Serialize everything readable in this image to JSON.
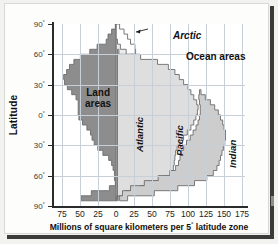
{
  "figure": {
    "axis_title_x": "Millions of square kilometers per 5° latitude zone",
    "axis_title_y": "Latitude",
    "label_land": "Land\nareas",
    "label_land_line1": "Land",
    "label_land_line2": "areas",
    "label_ocean": "Ocean areas",
    "label_arctic": "Arctic",
    "label_atlantic": "Atlantic",
    "label_pacific": "Pacific",
    "label_indian": "Indian"
  },
  "colors": {
    "land": "#8d8d8d",
    "arctic": "#ffffff",
    "atlantic": "#ececeb",
    "pacific": "#dedede",
    "indian": "#cdcdcd",
    "outline": "#6d6d6d",
    "axis": "#2b2b2b",
    "grid": "#c9cfd6",
    "plot_bg": "#ffffff",
    "page_bg": "#fdfdfb"
  },
  "chart_data": {
    "type": "area",
    "title": "",
    "subtitle": "",
    "xlabel": "Millions of square kilometers per 5° latitude zone",
    "ylabel": "Latitude",
    "orientation": "horizontal-diverging",
    "grid": true,
    "legend_position": "inline-annotations",
    "xlim": [
      -87.5,
      187.5
    ],
    "ylim": [
      -90,
      90
    ],
    "xticks": [
      -75,
      -50,
      -25,
      0,
      25,
      50,
      75,
      100,
      125,
      150,
      175
    ],
    "xtick_labels": [
      "75",
      "50",
      "25",
      "0",
      "25",
      "50",
      "75",
      "100",
      "125",
      "150",
      "175"
    ],
    "yticks": [
      90,
      60,
      30,
      0,
      -30,
      -60,
      -90
    ],
    "ytick_labels": [
      "90°",
      "60°",
      "30°",
      "0°",
      "30°",
      "60°",
      "90°"
    ],
    "x_units": "millions of square kilometers per 5° latitude zone",
    "y_units": "degrees latitude",
    "bands": [
      90,
      85,
      80,
      75,
      70,
      65,
      60,
      55,
      50,
      45,
      40,
      35,
      30,
      25,
      20,
      15,
      10,
      5,
      0,
      -5,
      -10,
      -15,
      -20,
      -25,
      -30,
      -35,
      -40,
      -45,
      -50,
      -55,
      -60,
      -65,
      -70,
      -75,
      -80,
      -85,
      -90
    ],
    "series": [
      {
        "name": "Land areas",
        "side": "left",
        "color": "#8d8d8d",
        "values": [
          1,
          6,
          11,
          14,
          19,
          26,
          36,
          49,
          58,
          64,
          68,
          72,
          71,
          66,
          59,
          55,
          52,
          52,
          50,
          46,
          40,
          36,
          34,
          31,
          25,
          17,
          10,
          7,
          5,
          3,
          2,
          2,
          9,
          34,
          48,
          41
        ]
      },
      {
        "name": "Arctic",
        "side": "right",
        "color": "#ffffff",
        "values": [
          5,
          11,
          16,
          20,
          25,
          26,
          21,
          12,
          4,
          1,
          0,
          0,
          0,
          0,
          0,
          0,
          0,
          0,
          0,
          0,
          0,
          0,
          0,
          0,
          0,
          0,
          0,
          0,
          0,
          0,
          0,
          0,
          0,
          0,
          0,
          0
        ]
      },
      {
        "name": "Atlantic",
        "side": "right",
        "color": "#ececeb",
        "values": [
          0,
          0,
          0,
          2,
          6,
          14,
          24,
          31,
          34,
          36,
          37,
          37,
          37,
          38,
          39,
          40,
          41,
          42,
          43,
          44,
          45,
          45,
          44,
          42,
          40,
          38,
          36,
          35,
          36,
          38,
          40,
          36,
          22,
          6,
          1,
          0
        ]
      },
      {
        "name": "Pacific",
        "side": "right",
        "color": "#dedede",
        "values": [
          0,
          0,
          0,
          0,
          0,
          2,
          10,
          26,
          42,
          52,
          58,
          62,
          65,
          68,
          72,
          76,
          79,
          80,
          79,
          76,
          72,
          68,
          64,
          60,
          56,
          52,
          49,
          47,
          46,
          46,
          45,
          40,
          25,
          7,
          1,
          0
        ]
      },
      {
        "name": "Indian",
        "side": "right",
        "color": "#cdcdcd",
        "values": [
          0,
          0,
          0,
          0,
          0,
          0,
          0,
          0,
          0,
          0,
          0,
          0,
          0,
          2,
          6,
          11,
          17,
          22,
          26,
          29,
          31,
          33,
          34,
          35,
          35,
          34,
          33,
          32,
          31,
          30,
          28,
          24,
          15,
          4,
          1,
          0
        ]
      }
    ],
    "annotations": [
      {
        "text": "Arctic",
        "style": "italic-bold",
        "leader": true,
        "points_to": "arctic ocean wedge near 70-85° N"
      },
      {
        "text": "Ocean areas",
        "style": "bold",
        "leader": false
      },
      {
        "text": "Land areas",
        "style": "bold",
        "leader": false
      },
      {
        "text": "Atlantic",
        "style": "italic-bold-rotated",
        "leader": false
      },
      {
        "text": "Pacific",
        "style": "italic-bold-rotated",
        "leader": false
      },
      {
        "text": "Indian",
        "style": "italic-bold-rotated",
        "leader": false
      }
    ]
  }
}
